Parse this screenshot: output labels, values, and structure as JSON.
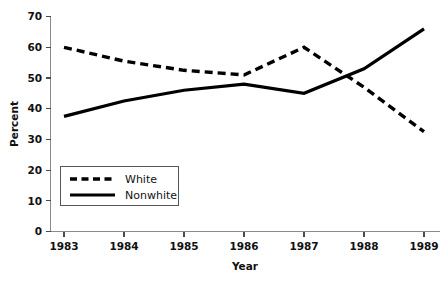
{
  "chart_data": {
    "type": "line",
    "title": "",
    "xlabel": "Year",
    "ylabel": "Percent",
    "categories": [
      "1983",
      "1984",
      "1985",
      "1986",
      "1987",
      "1988",
      "1989"
    ],
    "x": [
      1983,
      1984,
      1985,
      1986,
      1987,
      1988,
      1989
    ],
    "series": [
      {
        "name": "White",
        "style": "dashed",
        "color": "#000000",
        "values": [
          60,
          55.5,
          52.5,
          51,
          60,
          47,
          32.5
        ]
      },
      {
        "name": "Nonwhite",
        "style": "solid",
        "color": "#000000",
        "values": [
          37.5,
          42.5,
          46,
          48,
          45,
          53,
          66
        ]
      }
    ],
    "xlim": [
      1983,
      1989
    ],
    "ylim": [
      0,
      70
    ],
    "yticks": [
      0,
      10,
      20,
      30,
      40,
      50,
      60,
      70
    ],
    "ytick_labels": [
      "0",
      "10",
      "20",
      "30",
      "40",
      "50",
      "60",
      "70"
    ],
    "xtick_labels": [
      "1983",
      "1984",
      "1985",
      "1986",
      "1987",
      "1988",
      "1989"
    ],
    "grid": false,
    "legend_position": "lower-left",
    "legend_entries": [
      "White",
      "Nonwhite"
    ]
  },
  "axes": {
    "y_title": "Percent",
    "x_title": "Year"
  },
  "legend": {
    "items": [
      {
        "label": "White"
      },
      {
        "label": "Nonwhite"
      }
    ]
  }
}
